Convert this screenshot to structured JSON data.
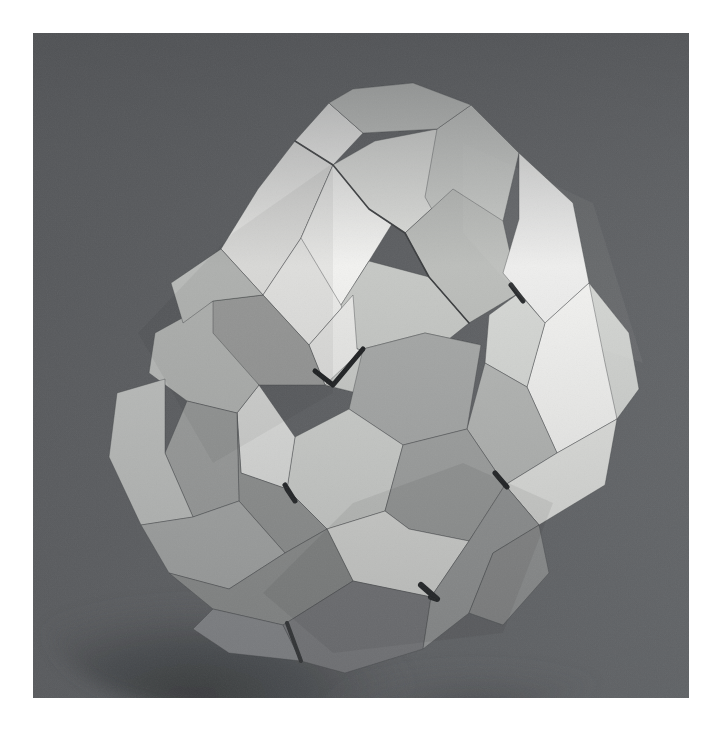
{
  "page": {
    "background_color": "#ffffff",
    "margin_left": 33,
    "margin_top": 33,
    "photo_width": 656,
    "photo_height": 665
  },
  "photograph": {
    "subject": "modular origami polyhedron",
    "medium": "folded paper",
    "orientation": "square format still life",
    "background_color": "#5c5e60",
    "background_color_top_left": "#55575a",
    "background_color_bottom_right": "#64666a",
    "surface_shadow_color": "#3c3e40",
    "lighting": "soft directional light from upper right"
  },
  "palette": {
    "paper_highlight": "#f2f2f0",
    "paper_bright": "#e6e6e4",
    "paper_light": "#d8d9d6",
    "paper_mid": "#c3c5c3",
    "paper_mid_dark": "#aaacab",
    "paper_shade": "#969897",
    "paper_dark": "#848685",
    "paper_deep": "#747676",
    "paper_deepest": "#66686a",
    "crease_dark": "#3a3c3e",
    "crevice_black": "#1d1f21"
  },
  "model": {
    "name": "modular origami polyhedron",
    "module_count_visible": 12,
    "face_type": "concave square cup faces",
    "silhouette_bounds": {
      "left": 105,
      "top": 128,
      "right": 600,
      "bottom": 640
    }
  },
  "facets": {
    "note": "Each entry is one visible paper facet polygon, in photo-local pixel coordinates (origin at photo top-left), with its rendered fill tone.",
    "list": [
      {
        "name": "top-cup-outer-left-wing",
        "fill": "#e4e4e2",
        "points": "188,216 225,156 262,108 300,132 268,205 230,262"
      },
      {
        "name": "top-cup-rim-left",
        "fill": "#f0f0ee",
        "points": "262,108 300,132 330,100 296,70"
      },
      {
        "name": "top-cup-inner-left-wall",
        "fill": "#eaeae8",
        "points": "230,262 268,205 300,132 336,176 320,262 276,312"
      },
      {
        "name": "top-cup-inner-face-bright",
        "fill": "#f2f2f0",
        "points": "268,205 300,132 342,108 372,170 336,228 308,272"
      },
      {
        "name": "top-cup-center-panel",
        "fill": "#dedfdc",
        "points": "300,132 342,108 404,96 420,156 372,200 336,176"
      },
      {
        "name": "top-cup-upper-rim",
        "fill": "#cfd1ce",
        "points": "296,70 330,100 404,96 438,72 380,50 320,56"
      },
      {
        "name": "top-cup-right-inner",
        "fill": "#c9cbc8",
        "points": "404,96 438,72 486,120 470,188 420,214 392,164"
      },
      {
        "name": "top-cup-right-wall",
        "fill": "#bcbebb",
        "points": "420,156 470,188 486,260 436,290 396,244 372,200"
      },
      {
        "name": "top-cup-bottom-inner",
        "fill": "#c6c8c5",
        "points": "308,272 336,228 396,244 436,290 386,330 324,316"
      },
      {
        "name": "top-cup-rim-front",
        "fill": "#e8e8e6",
        "points": "276,312 320,262 324,316 386,330 356,368 292,352"
      },
      {
        "name": "top-right-flap-bright",
        "fill": "#eeeeec",
        "points": "486,120 540,170 556,250 512,290 470,240 486,186"
      },
      {
        "name": "right-cup-outer-bright",
        "fill": "#f2f2f0",
        "points": "512,290 556,250 596,300 584,386 524,420 494,354"
      },
      {
        "name": "right-cup-rim-top",
        "fill": "#d6d8d5",
        "points": "486,260 512,290 494,354 452,330 456,282"
      },
      {
        "name": "right-cup-inner-shade",
        "fill": "#b4b6b4",
        "points": "452,330 494,354 524,420 472,452 434,396"
      },
      {
        "name": "right-lower-panel",
        "fill": "#e0e1de",
        "points": "524,420 584,386 572,452 506,492 472,452"
      },
      {
        "name": "right-lower-edge",
        "fill": "#b0b2b0",
        "points": "472,452 506,492 460,520 428,484"
      },
      {
        "name": "center-cup-rim-top",
        "fill": "#c8cac7",
        "points": "292,352 356,368 420,350 448,312 392,300 330,316"
      },
      {
        "name": "center-cup-wall-upper",
        "fill": "#a6a8a7",
        "points": "330,316 392,300 448,312 434,396 370,412 316,376"
      },
      {
        "name": "center-cup-wall-left",
        "fill": "#cdcfcc",
        "points": "262,404 316,376 370,412 352,478 294,496 254,456"
      },
      {
        "name": "center-cup-wall-right",
        "fill": "#9fa1a0",
        "points": "370,412 434,396 472,452 436,508 376,496 352,478"
      },
      {
        "name": "center-cup-wall-bottom",
        "fill": "#e2e3e0",
        "points": "294,496 352,478 376,496 436,508 398,564 320,548"
      },
      {
        "name": "center-cup-left-outer",
        "fill": "#dcdddb",
        "points": "226,352 262,404 254,456 208,440 204,380"
      },
      {
        "name": "center-cup-left-edge",
        "fill": "#8e908f",
        "points": "204,380 208,440 254,456 294,496 252,520 206,468"
      },
      {
        "name": "left-cup-outer-upper",
        "fill": "#b6b8b6",
        "points": "122,300 180,268 226,352 204,380 154,368 116,340"
      },
      {
        "name": "left-cup-inner-top",
        "fill": "#9a9c9b",
        "points": "154,368 204,380 206,468 160,484 132,420"
      },
      {
        "name": "left-cup-inner-left",
        "fill": "#bcbebc",
        "points": "84,360 132,346 132,420 160,484 108,492 76,424"
      },
      {
        "name": "left-cup-bottom-panel",
        "fill": "#a4a6a5",
        "points": "108,492 160,484 206,468 252,520 196,556 136,540"
      },
      {
        "name": "left-cup-lower-edge",
        "fill": "#8a8c8b",
        "points": "136,540 196,556 252,520 294,496 320,548 250,592 180,576"
      },
      {
        "name": "left-upper-shoulder",
        "fill": "#9c9e9c",
        "points": "180,268 230,262 276,312 292,352 226,352 180,300"
      },
      {
        "name": "upper-left-flap",
        "fill": "#b8bab8",
        "points": "138,250 188,216 230,262 180,268 150,290"
      },
      {
        "name": "bottom-left-panel",
        "fill": "#85878a",
        "points": "180,576 250,592 268,628 196,620 160,596"
      },
      {
        "name": "bottom-center-panel",
        "fill": "#78797c",
        "points": "250,592 320,548 398,564 390,616 312,640 268,628"
      },
      {
        "name": "bottom-right-panel",
        "fill": "#9a9c9c",
        "points": "398,564 436,508 472,452 506,492 460,520 436,580 390,616"
      },
      {
        "name": "bottom-far-right",
        "fill": "#8e9090",
        "points": "436,580 460,520 506,492 516,540 470,592"
      },
      {
        "name": "right-shoulder-tall",
        "fill": "#d2d4d1",
        "points": "556,250 596,300 606,356 584,386 572,330"
      },
      {
        "name": "top-left-outer-edge",
        "fill": "#c4c6c3",
        "points": "296,70 320,56 380,50 438,72 404,96 330,100"
      }
    ]
  },
  "creases": {
    "note": "Dark crease / crevice lines between modules, photo-local coordinates.",
    "list": [
      {
        "name": "crease-top-cup-left",
        "color": "#3a3c3e",
        "points": "262,108 300,132 336,176 372,200 396,244 436,290",
        "width": 1.6
      },
      {
        "name": "crevice-center-top",
        "color": "#1d1f21",
        "points": "282,338 300,352 330,316",
        "width": 5
      },
      {
        "name": "crevice-center-left",
        "color": "#1d1f21",
        "points": "252,452 262,468 254,456",
        "width": 5
      },
      {
        "name": "crevice-center-bottom",
        "color": "#1d1f21",
        "points": "388,552 404,566 398,564",
        "width": 6
      },
      {
        "name": "crevice-center-right",
        "color": "#1d1f21",
        "points": "462,440 474,454 472,452",
        "width": 5
      },
      {
        "name": "crevice-right-upper",
        "color": "#26282a",
        "points": "478,252 490,268",
        "width": 5
      },
      {
        "name": "crease-bottom-gap",
        "color": "#2a2c2e",
        "points": "254,590 268,628",
        "width": 4
      }
    ]
  },
  "interaction": {
    "selectable": false,
    "alt_text": "Photograph of a white modular origami polyhedron with concave square cup faces, lit from the upper right, on a neutral gray backdrop."
  }
}
